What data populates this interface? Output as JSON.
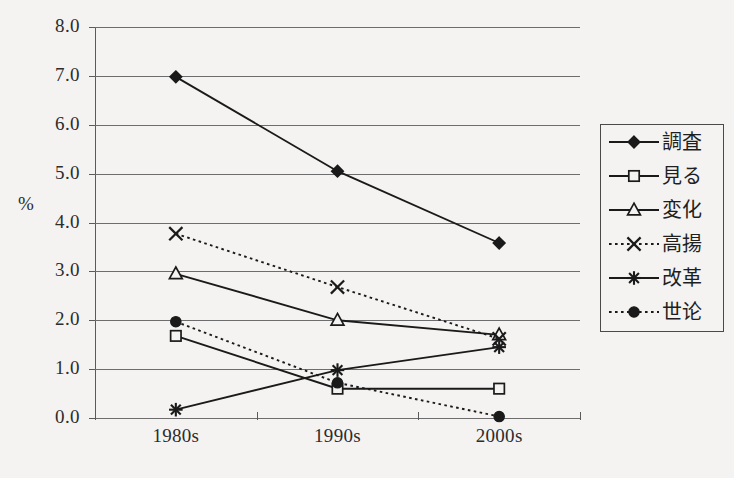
{
  "chart_data": {
    "type": "line",
    "title": "",
    "subtitle": "",
    "xlabel": "",
    "ylabel": "%",
    "categories": [
      "1980s",
      "1990s",
      "2000s"
    ],
    "ylim": [
      0.0,
      8.0
    ],
    "ytick_labels": [
      "0.0",
      "1.0",
      "2.0",
      "3.0",
      "4.0",
      "5.0",
      "6.0",
      "7.0",
      "8.0"
    ],
    "ytick_values": [
      0.0,
      1.0,
      2.0,
      3.0,
      4.0,
      5.0,
      6.0,
      7.0,
      8.0
    ],
    "grid": "horizontal",
    "legend_position": "right",
    "series": [
      {
        "name": "調査",
        "marker": "filled-diamond",
        "linestyle": "solid",
        "color": "#1a1a1a",
        "values": [
          6.98,
          5.05,
          3.58
        ]
      },
      {
        "name": "見る",
        "marker": "open-square",
        "linestyle": "solid",
        "color": "#1a1a1a",
        "values": [
          1.68,
          0.6,
          0.6
        ]
      },
      {
        "name": "変化",
        "marker": "open-triangle",
        "linestyle": "solid",
        "color": "#1a1a1a",
        "values": [
          2.95,
          2.0,
          1.7
        ]
      },
      {
        "name": "高揚",
        "marker": "cross-x",
        "linestyle": "dotted",
        "color": "#1a1a1a",
        "values": [
          3.77,
          2.68,
          1.62
        ]
      },
      {
        "name": "改革",
        "marker": "asterisk",
        "linestyle": "solid",
        "color": "#1a1a1a",
        "values": [
          0.17,
          0.98,
          1.45
        ]
      },
      {
        "name": "世论",
        "marker": "filled-circle",
        "linestyle": "dotted",
        "color": "#1a1a1a",
        "values": [
          1.97,
          0.72,
          0.03
        ]
      }
    ]
  },
  "axes": {
    "y_title": "%",
    "y_labels": [
      "8.0",
      "7.0",
      "6.0",
      "5.0",
      "4.0",
      "3.0",
      "2.0",
      "1.0",
      "0.0"
    ],
    "x_labels": [
      "1980s",
      "1990s",
      "2000s"
    ]
  },
  "legend": {
    "items": [
      {
        "label": "調査",
        "marker": "filled-diamond",
        "linestyle": "solid"
      },
      {
        "label": "見る",
        "marker": "open-square",
        "linestyle": "solid"
      },
      {
        "label": "変化",
        "marker": "open-triangle",
        "linestyle": "solid"
      },
      {
        "label": "高揚",
        "marker": "cross-x",
        "linestyle": "dotted"
      },
      {
        "label": "改革",
        "marker": "asterisk",
        "linestyle": "solid"
      },
      {
        "label": "世论",
        "marker": "filled-circle",
        "linestyle": "dotted"
      }
    ]
  },
  "colors": {
    "background": "#f4f3f1",
    "ink": "#1a1a1a",
    "grid": "#6d6d6d",
    "axis": "#5a5a5a"
  }
}
